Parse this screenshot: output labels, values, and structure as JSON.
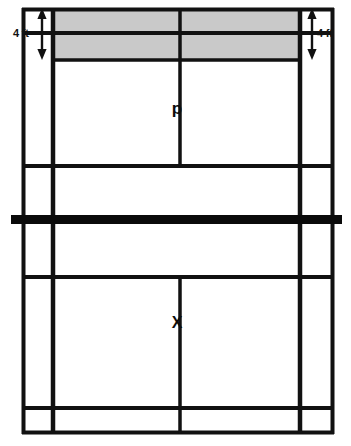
{
  "diagram": {
    "type": "tennis-court-plan-view",
    "background_color": "#ffffff",
    "line_color": "#111111",
    "shaded_color": "#c9c9c9",
    "net_color": "#0a0a0a",
    "labels": {
      "dimension_left": "4 ft",
      "dimension_right": "4 ft",
      "point_upper": "p",
      "point_lower": "X"
    },
    "icons": {
      "arrow_left": "double-headed-vertical-arrow",
      "arrow_right": "double-headed-vertical-arrow"
    },
    "geometry": {
      "court_left": 22,
      "court_right": 334,
      "court_top": 8,
      "court_bottom": 434,
      "singles_left": 52,
      "singles_right": 301,
      "center_x": 180,
      "line_baseline_top": 8,
      "line_shade_mid": 33,
      "line_service_top": 60,
      "line_mid_upper": 166,
      "net_y": 220,
      "line_mid_lower": 277,
      "line_service_bottom": 408,
      "shaded_top": 8,
      "shaded_bottom": 60
    }
  }
}
